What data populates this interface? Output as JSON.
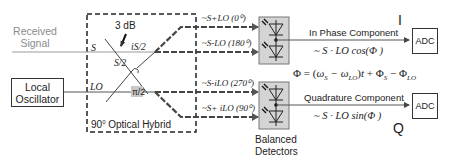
{
  "diagram": {
    "inputs": {
      "received_signal": "Received\nSignal",
      "received_signal_line1": "Received",
      "received_signal_line2": "Signal",
      "local_oscillator_line1": "Local",
      "local_oscillator_line2": "Oscillator"
    },
    "hybrid": {
      "label": "90⁰ Optical Hybrid",
      "label_prefix": "90",
      "label_sup": "0",
      "label_suffix": " Optical Hybrid",
      "coupler_label": "3 dB",
      "s_port": "S",
      "lo_port": "LO",
      "is2": "iS/2",
      "s2": "S/2",
      "phase_shift": "π/2"
    },
    "outputs": [
      {
        "label": "~S+LO (0⁰)"
      },
      {
        "label": "~S-LO (180⁰)"
      },
      {
        "label": "~S-iLO (270⁰)"
      },
      {
        "label": "~S+ iLO (90⁰)"
      }
    ],
    "detectors": {
      "label_line1": "Balanced",
      "label_line2": "Detectors"
    },
    "in_phase": {
      "name": "In Phase Component",
      "formula": "~ S · LO cos(Φ )",
      "channel": "I",
      "adc": "ADC"
    },
    "quadrature": {
      "name": "Quadrature Component",
      "formula": "~ S · LO sin(Φ )",
      "channel": "Q",
      "adc": "ADC"
    },
    "phase_equation": "Φ = (ωS − ωLO)t + ΦS − ΦLO",
    "colors": {
      "line": "#333333",
      "received_line": "#9a9a9a",
      "detector_fill": "#d4d4d4",
      "phase_box": "#c8c8c8"
    }
  }
}
